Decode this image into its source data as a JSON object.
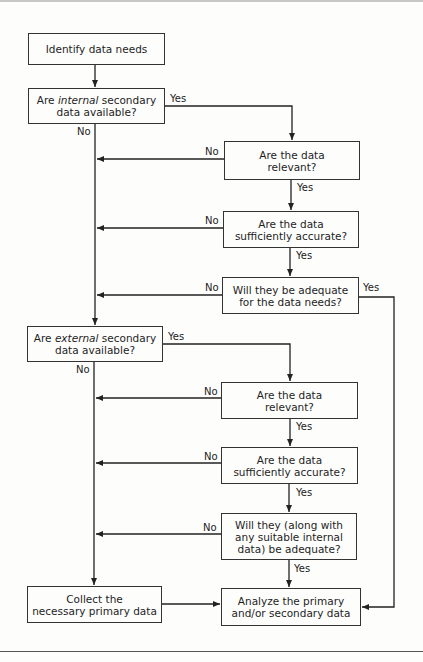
{
  "flowchart": {
    "nodes": {
      "identify": "Identify data needs",
      "internal_pre": "Are ",
      "internal_em": "internal",
      "internal_post": " secondary\ndata available?",
      "int_relevant": "Are the data\nrelevant?",
      "int_accurate": "Are the data\nsufficiently accurate?",
      "int_adequate": "Will they be adequate\nfor the data needs?",
      "external_pre": "Are ",
      "external_em": "external",
      "external_post": " secondary\ndata available?",
      "ext_relevant": "Are the data\nrelevant?",
      "ext_accurate": "Are the data\nsufficiently accurate?",
      "ext_adequate": "Will they (along with\nany suitable internal\ndata) be adequate?",
      "collect": "Collect the\nnecessary primary data",
      "analyze": "Analyze the primary\nand/or secondary data"
    },
    "labels": {
      "yes": "Yes",
      "no": "No"
    }
  }
}
